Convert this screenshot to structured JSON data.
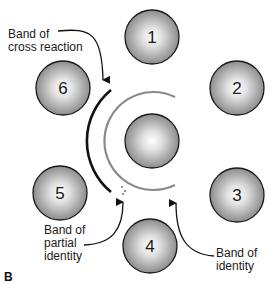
{
  "diagram": {
    "panel_label": "B",
    "wells": [
      {
        "id": "well-1",
        "label": "1",
        "cx": 152,
        "cy": 37
      },
      {
        "id": "well-2",
        "label": "2",
        "cx": 237,
        "cy": 88
      },
      {
        "id": "well-3",
        "label": "3",
        "cx": 237,
        "cy": 195
      },
      {
        "id": "well-4",
        "label": "4",
        "cx": 150,
        "cy": 246
      },
      {
        "id": "well-5",
        "label": "5",
        "cx": 60,
        "cy": 193
      },
      {
        "id": "well-6",
        "label": "6",
        "cx": 63,
        "cy": 88
      }
    ],
    "center_well": {
      "cx": 152,
      "cy": 141
    },
    "annotations": {
      "cross_reaction": "Band of\ncross reaction",
      "partial_identity": "Band of\npartial\nidentity",
      "identity": "Band of\nidentity"
    },
    "colors": {
      "outer_band": "#111111",
      "inner_band": "#8a8a8a",
      "well_edge": "#1a1a1a",
      "well_fill_light": "#ffffff",
      "well_fill_dark": "#8c8c8c"
    }
  }
}
